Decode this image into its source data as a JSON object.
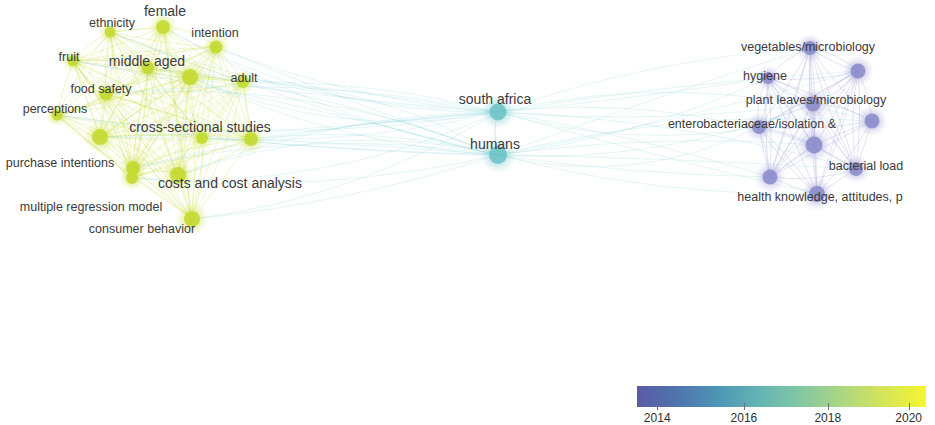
{
  "visualization": {
    "type": "bibliometric-network-map",
    "background_color": "#ffffff",
    "width": 935,
    "height": 425
  },
  "clusters": [
    {
      "name": "consumer-behavior-cluster",
      "color": "#c3d92e",
      "position": "left"
    },
    {
      "name": "bridge-cluster",
      "color": "#6dc3c6",
      "position": "center"
    },
    {
      "name": "microbiology-cluster",
      "color": "#8b8bcb",
      "position": "right"
    }
  ],
  "nodes": [
    {
      "id": "female",
      "label": "female",
      "x": 165,
      "y": 11,
      "nx": 163,
      "ny": 27,
      "r": 7,
      "color": "#c3d92e",
      "cluster": "consumer-behavior-cluster",
      "size": "lg"
    },
    {
      "id": "ethnicity",
      "label": "ethnicity",
      "x": 112,
      "y": 23,
      "nx": 110,
      "ny": 32,
      "r": 5.5,
      "color": "#c3d92e",
      "cluster": "consumer-behavior-cluster",
      "size": "md"
    },
    {
      "id": "intention",
      "label": "intention",
      "x": 215,
      "y": 33,
      "nx": 216,
      "ny": 47,
      "r": 6.5,
      "color": "#c3d92e",
      "cluster": "consumer-behavior-cluster",
      "size": "md"
    },
    {
      "id": "fruit",
      "label": "fruit",
      "x": 69,
      "y": 57,
      "nx": 73,
      "ny": 61,
      "r": 5.5,
      "color": "#c3d92e",
      "cluster": "consumer-behavior-cluster",
      "size": "md"
    },
    {
      "id": "middle-aged",
      "label": "middle aged",
      "x": 147,
      "y": 61,
      "nx": 148,
      "ny": 68,
      "r": 6.5,
      "color": "#c3d92e",
      "cluster": "consumer-behavior-cluster",
      "size": "lg"
    },
    {
      "id": "adult",
      "label": "adult",
      "x": 244,
      "y": 78,
      "nx": 243,
      "ny": 82,
      "r": 6,
      "color": "#c3d92e",
      "cluster": "consumer-behavior-cluster",
      "size": "md"
    },
    {
      "id": "food-safety",
      "label": "food safety",
      "x": 101,
      "y": 89,
      "nx": 106,
      "ny": 94,
      "r": 6.5,
      "color": "#c3d92e",
      "cluster": "consumer-behavior-cluster",
      "size": "md"
    },
    {
      "id": "hub-a",
      "label": "",
      "x": 190,
      "y": 77,
      "nx": 190,
      "ny": 77,
      "r": 8,
      "color": "#c3d92e",
      "cluster": "consumer-behavior-cluster",
      "size": "md"
    },
    {
      "id": "perceptions",
      "label": "perceptions",
      "x": 55,
      "y": 109,
      "nx": 57,
      "ny": 115,
      "r": 5.5,
      "color": "#c3d92e",
      "cluster": "consumer-behavior-cluster",
      "size": "md"
    },
    {
      "id": "cross-sectional-studies",
      "label": "cross-sectional studies",
      "x": 200,
      "y": 127,
      "nx": 202,
      "ny": 138,
      "r": 6,
      "color": "#c3d92e",
      "cluster": "consumer-behavior-cluster",
      "size": "lg"
    },
    {
      "id": "hub-b",
      "label": "",
      "x": 100,
      "y": 137,
      "nx": 100,
      "ny": 137,
      "r": 8,
      "color": "#c3d92e",
      "cluster": "consumer-behavior-cluster",
      "size": "md"
    },
    {
      "id": "hub-c",
      "label": "",
      "x": 251,
      "y": 139,
      "nx": 251,
      "ny": 139,
      "r": 7,
      "color": "#c3d92e",
      "cluster": "consumer-behavior-cluster",
      "size": "md"
    },
    {
      "id": "purchase-intentions",
      "label": "purchase intentions",
      "x": 60,
      "y": 163,
      "nx": 133,
      "ny": 168,
      "r": 7,
      "color": "#c3d92e",
      "cluster": "consumer-behavior-cluster",
      "size": "md"
    },
    {
      "id": "costs-and-cost-analysis",
      "label": "costs and cost analysis",
      "x": 230,
      "y": 183,
      "nx": 178,
      "ny": 175,
      "r": 8,
      "color": "#c3d92e",
      "cluster": "consumer-behavior-cluster",
      "size": "lg"
    },
    {
      "id": "multiple-regression-model",
      "label": "multiple regression model",
      "x": 91,
      "y": 207,
      "nx": 132,
      "ny": 178,
      "r": 6,
      "color": "#c3d92e",
      "cluster": "consumer-behavior-cluster",
      "size": "md"
    },
    {
      "id": "consumer-behavior",
      "label": "consumer behavior",
      "x": 142,
      "y": 229,
      "nx": 192,
      "ny": 219,
      "r": 8,
      "color": "#c3d92e",
      "cluster": "consumer-behavior-cluster",
      "size": "md"
    },
    {
      "id": "south-africa",
      "label": "south africa",
      "x": 495,
      "y": 99,
      "nx": 498,
      "ny": 112,
      "r": 8.5,
      "color": "#6dc3c6",
      "cluster": "bridge-cluster",
      "size": "lg"
    },
    {
      "id": "humans",
      "label": "humans",
      "x": 495,
      "y": 144,
      "nx": 498,
      "ny": 155,
      "r": 9,
      "color": "#6dc3c6",
      "cluster": "bridge-cluster",
      "size": "lg"
    },
    {
      "id": "vegetables-microbiology",
      "label": "vegetables/microbiology",
      "x": 808,
      "y": 47,
      "nx": 810,
      "ny": 48,
      "r": 7,
      "color": "#8b8bcb",
      "cluster": "microbiology-cluster",
      "size": "md"
    },
    {
      "id": "node-top-right",
      "label": "",
      "x": 858,
      "y": 71,
      "nx": 858,
      "ny": 71,
      "r": 7.5,
      "color": "#8b8bcb",
      "cluster": "microbiology-cluster",
      "size": "md"
    },
    {
      "id": "hygiene",
      "label": "hygiene",
      "x": 765,
      "y": 76,
      "nx": 768,
      "ny": 78,
      "r": 6,
      "color": "#8b8bcb",
      "cluster": "microbiology-cluster",
      "size": "md"
    },
    {
      "id": "plant-leaves-microbiology",
      "label": "plant leaves/microbiology",
      "x": 816,
      "y": 100,
      "nx": 813,
      "ny": 104,
      "r": 7.5,
      "color": "#8b8bcb",
      "cluster": "microbiology-cluster",
      "size": "md"
    },
    {
      "id": "enterobacteriaceae-isolation",
      "label": "enterobacteriaceae/isolation &",
      "x": 752,
      "y": 124,
      "nx": 759,
      "ny": 127,
      "r": 7,
      "color": "#8b8bcb",
      "cluster": "microbiology-cluster",
      "size": "md"
    },
    {
      "id": "node-mid-right",
      "label": "",
      "x": 872,
      "y": 121,
      "nx": 872,
      "ny": 121,
      "r": 7.5,
      "color": "#8b8bcb",
      "cluster": "microbiology-cluster",
      "size": "md"
    },
    {
      "id": "node-center-lower",
      "label": "",
      "x": 814,
      "y": 145,
      "nx": 814,
      "ny": 145,
      "r": 8.5,
      "color": "#8b8bcb",
      "cluster": "microbiology-cluster",
      "size": "md"
    },
    {
      "id": "bacterial-load",
      "label": "bacterial load",
      "x": 866,
      "y": 166,
      "nx": 856,
      "ny": 169,
      "r": 7,
      "color": "#8b8bcb",
      "cluster": "microbiology-cluster",
      "size": "md"
    },
    {
      "id": "node-left-lower",
      "label": "",
      "x": 770,
      "y": 177,
      "nx": 770,
      "ny": 177,
      "r": 7.5,
      "color": "#8b8bcb",
      "cluster": "microbiology-cluster",
      "size": "md"
    },
    {
      "id": "health-knowledge",
      "label": "health knowledge, attitudes, p",
      "x": 820,
      "y": 197,
      "nx": 817,
      "ny": 194,
      "r": 8,
      "color": "#8b8bcb",
      "cluster": "microbiology-cluster",
      "size": "md"
    }
  ],
  "legend": {
    "name": "year-color-scale",
    "ticks": [
      {
        "year": "2014",
        "pos_pct": 7
      },
      {
        "year": "2016",
        "pos_pct": 37
      },
      {
        "year": "2018",
        "pos_pct": 66
      },
      {
        "year": "2020",
        "pos_pct": 94
      }
    ],
    "gradient_stops": [
      "#5b5ba6",
      "#4e95b4",
      "#63b4b4",
      "#a9d585",
      "#f5f531"
    ]
  }
}
